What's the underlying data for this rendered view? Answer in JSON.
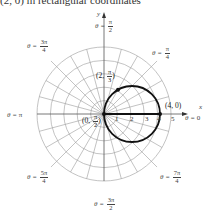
{
  "header": {
    "text": "(2, 0) in rectangular coordinates"
  },
  "axes": {
    "x_label": "x",
    "y_label": "y",
    "ticks": [
      "1",
      "2",
      "3",
      "4",
      "5"
    ]
  },
  "angle_labels": [
    {
      "id": "theta_0",
      "prefix": "θ = ",
      "text": "0"
    },
    {
      "id": "theta_pi_4",
      "prefix": "θ = ",
      "num": "π",
      "den": "4"
    },
    {
      "id": "theta_pi_2",
      "prefix": "θ = ",
      "num": "π",
      "den": "2"
    },
    {
      "id": "theta_3pi_4",
      "prefix": "θ = ",
      "num": "3π",
      "den": "4"
    },
    {
      "id": "theta_pi",
      "prefix": "θ = ",
      "text": "π"
    },
    {
      "id": "theta_5pi_4",
      "prefix": "θ = ",
      "num": "5π",
      "den": "4"
    },
    {
      "id": "theta_3pi_2",
      "prefix": "θ = ",
      "num": "3π",
      "den": "2"
    },
    {
      "id": "theta_7pi_4",
      "prefix": "θ = ",
      "num": "7π",
      "den": "4"
    }
  ],
  "points": [
    {
      "id": "p_origin",
      "open": "(0, ",
      "num": "π",
      "den": "2",
      "close": ")"
    },
    {
      "id": "p_2_pi3",
      "open": "(2, ",
      "num": "π",
      "den": "3",
      "close": ")"
    },
    {
      "id": "p_4_0",
      "text": "(4, 0)"
    }
  ],
  "curve": {
    "equation": "r = 4 cos θ",
    "center_polar": [
      2,
      0
    ],
    "radius": 2,
    "color": "#111111"
  },
  "grid": {
    "rings": 5,
    "radial_step_deg": 15,
    "color": "#9a9a9a"
  }
}
